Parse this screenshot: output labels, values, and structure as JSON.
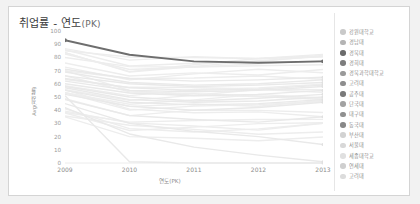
{
  "card": {
    "title_main": "취업률 - 연도",
    "title_sub": "(PK)"
  },
  "chart_data": {
    "type": "line",
    "title": "취업률 - 연도(PK)",
    "xlabel": "연도(PK)",
    "ylabel": "Avg(취업률)",
    "x": [
      2009,
      2010,
      2011,
      2012,
      2013
    ],
    "xtick_labels": [
      "2009",
      "2010",
      "2011",
      "2012",
      "2013"
    ],
    "ytick_labels": [
      "100",
      "90",
      "80",
      "70",
      "60",
      "50",
      "40",
      "30",
      "20",
      "10",
      "0"
    ],
    "ylim": [
      0,
      100
    ],
    "xlim": [
      2009,
      2013
    ],
    "grid": false,
    "legend_position": "right",
    "highlight_color": "#6e6e6e",
    "muted_color": "#e3e3e3",
    "series": [
      {
        "name": "강원대학교",
        "color": "#c9c9c9",
        "highlight": false,
        "values": [
          62,
          55,
          54,
          55,
          58
        ]
      },
      {
        "name": "경남대",
        "color": "#b4b4b4",
        "highlight": false,
        "values": [
          66,
          60,
          58,
          59,
          61
        ]
      },
      {
        "name": "경북대",
        "color": "#6b6b6b",
        "highlight": true,
        "values": [
          93,
          82,
          77,
          76,
          77
        ]
      },
      {
        "name": "경희대",
        "color": "#7d7d7d",
        "highlight": false,
        "values": [
          71,
          64,
          62,
          63,
          65
        ]
      },
      {
        "name": "경북과학대학교",
        "color": "#9a9a9a",
        "highlight": false,
        "values": [
          58,
          50,
          47,
          49,
          52
        ]
      },
      {
        "name": "고려대",
        "color": "#8e8e8e",
        "highlight": false,
        "values": [
          69,
          61,
          59,
          60,
          63
        ]
      },
      {
        "name": "공주대",
        "color": "#7a7a7a",
        "highlight": false,
        "values": [
          64,
          57,
          55,
          56,
          59
        ]
      },
      {
        "name": "단국대",
        "color": "#a2a2a2",
        "highlight": false,
        "values": [
          60,
          53,
          51,
          52,
          55
        ]
      },
      {
        "name": "대구대",
        "color": "#909090",
        "highlight": false,
        "values": [
          55,
          46,
          44,
          45,
          48
        ]
      },
      {
        "name": "동국대",
        "color": "#888888",
        "highlight": false,
        "values": [
          52,
          43,
          40,
          42,
          46
        ]
      },
      {
        "name": "부산대",
        "color": "#d2d2d2",
        "highlight": false,
        "values": [
          48,
          36,
          33,
          31,
          35
        ]
      },
      {
        "name": "서울대",
        "color": "#d8d8d8",
        "highlight": false,
        "values": [
          45,
          30,
          24,
          20,
          14
        ]
      },
      {
        "name": "세종대학교",
        "color": "#e0e0e0",
        "highlight": false,
        "values": [
          42,
          22,
          12,
          6,
          1
        ]
      },
      {
        "name": "연세대",
        "color": "#cfcfcf",
        "highlight": false,
        "values": [
          57,
          48,
          46,
          47,
          50
        ]
      },
      {
        "name": "고려대",
        "color": "#dcdcdc",
        "highlight": false,
        "values": [
          51,
          1,
          0,
          0,
          0
        ]
      }
    ]
  }
}
